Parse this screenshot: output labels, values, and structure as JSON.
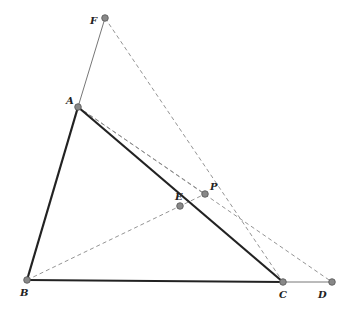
{
  "diagram": {
    "points": [
      {
        "name": "F",
        "x": 105,
        "y": 18,
        "lx": 90,
        "ly": 24
      },
      {
        "name": "A",
        "x": 78,
        "y": 107,
        "lx": 66,
        "ly": 104
      },
      {
        "name": "B",
        "x": 27,
        "y": 280,
        "lx": 20,
        "ly": 296
      },
      {
        "name": "C",
        "x": 283,
        "y": 282,
        "lx": 279,
        "ly": 298
      },
      {
        "name": "D",
        "x": 332,
        "y": 282,
        "lx": 318,
        "ly": 298
      },
      {
        "name": "E",
        "x": 180,
        "y": 206,
        "lx": 175,
        "ly": 200
      },
      {
        "name": "P",
        "x": 205,
        "y": 194,
        "lx": 210,
        "ly": 190
      }
    ],
    "segments": [
      {
        "from": "A",
        "to": "B",
        "style": "thick"
      },
      {
        "from": "A",
        "to": "C",
        "style": "thick"
      },
      {
        "from": "B",
        "to": "C",
        "style": "thick"
      },
      {
        "from": "A",
        "to": "F",
        "style": "thin"
      },
      {
        "from": "C",
        "to": "D",
        "style": "thin"
      },
      {
        "from": "F",
        "to": "C",
        "style": "dashed"
      },
      {
        "from": "A",
        "to": "D",
        "style": "dashed"
      },
      {
        "from": "A",
        "to": "P",
        "style": "dashed"
      },
      {
        "from": "B",
        "to": "P",
        "style": "dashed"
      }
    ]
  }
}
